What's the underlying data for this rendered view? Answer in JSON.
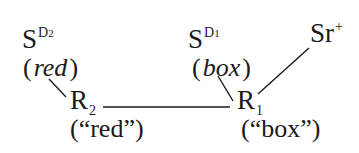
{
  "diagram": {
    "nodes": {
      "s_d2": {
        "base": "S",
        "sup": "D2",
        "sup_letter": "D",
        "sup_index": "2"
      },
      "red_italic": {
        "open": "(",
        "text": "red",
        "close": ")"
      },
      "r2": {
        "base": "R",
        "sub": "2"
      },
      "red_quoted": {
        "text": "(“red”)"
      },
      "s_d1": {
        "base": "S",
        "sup_letter": "D",
        "sup_index": "1"
      },
      "box_italic": {
        "open": "(",
        "text": "box",
        "close": ")"
      },
      "r1": {
        "base": "R",
        "sub": "1"
      },
      "box_quoted": {
        "text": "(“box”)"
      },
      "sr_plus": {
        "base": "Sr",
        "sup": "+"
      }
    },
    "edges": [
      {
        "from": "red_italic",
        "to": "r2"
      },
      {
        "from": "r2",
        "to": "r1"
      },
      {
        "from": "box_italic",
        "to": "r1"
      },
      {
        "from": "sr_plus",
        "to": "r1"
      }
    ],
    "colors": {
      "ink": "#1a1a1a",
      "background": "#ffffff"
    }
  }
}
